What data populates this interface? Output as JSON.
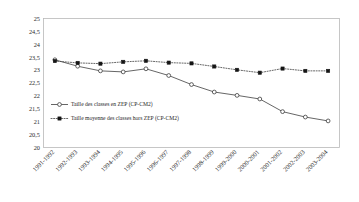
{
  "chart_data": {
    "type": "line",
    "title": "",
    "xlabel": "",
    "ylabel": "",
    "ylim": [
      20,
      25
    ],
    "ytick_step": 0.5,
    "grid": false,
    "legend_position": "inside-left-lower",
    "xtick_rotation_deg": 45,
    "categories": [
      "1991-1992",
      "1992-1993",
      "1993-1994",
      "1994-1995",
      "1995-1996",
      "1996-1997",
      "1997-1998",
      "1998-1999",
      "1999-2000",
      "2000-2001",
      "2001-2002",
      "2002-2003",
      "2003-2004"
    ],
    "ytick_labels": [
      "20",
      "20,5",
      "21",
      "21,5",
      "22",
      "22,5",
      "23",
      "23,5",
      "24",
      "24,5",
      "25"
    ],
    "ytick_values": [
      20,
      20.5,
      21,
      21.5,
      22,
      22.5,
      23,
      23.5,
      24,
      24.5,
      25
    ],
    "series": [
      {
        "name": "Taille des classes en ZEP (CP-CM2)",
        "marker": "open-circle",
        "line_style": "solid",
        "color": "#4a4a4a",
        "values": [
          23.4,
          23.15,
          22.97,
          22.93,
          23.05,
          22.79,
          22.44,
          22.15,
          22.02,
          21.88,
          21.39,
          21.18,
          21.03
        ]
      },
      {
        "name": "Taille moyenne des classes hors ZEP (CP-CM2)",
        "marker": "filled-square",
        "line_style": "dotted",
        "color": "#151515",
        "values": [
          23.35,
          23.28,
          23.25,
          23.32,
          23.36,
          23.29,
          23.26,
          23.14,
          23.01,
          22.9,
          23.06,
          22.97,
          22.97
        ]
      }
    ]
  },
  "colors": {
    "frame": "#b9b9b9",
    "text": "#2b2b2b",
    "series_zep": "#4a4a4a",
    "series_hors_zep": "#151515",
    "background": "#ffffff"
  }
}
